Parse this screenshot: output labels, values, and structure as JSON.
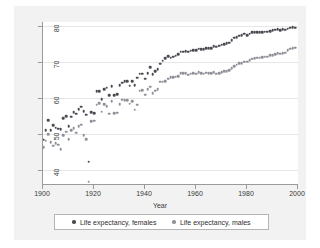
{
  "chart_data": {
    "type": "scatter",
    "title": "",
    "xlabel": "Year",
    "ylabel": "",
    "xlim": [
      1900,
      2000
    ],
    "ylim": [
      36,
      81
    ],
    "xticks": [
      1900,
      1920,
      1940,
      1960,
      1980,
      2000
    ],
    "yticks": [
      40,
      50,
      60,
      70,
      80
    ],
    "grid": "horizontal",
    "legend_position": "bottom",
    "colors": {
      "females": "#4a4a52",
      "males": "#90909a",
      "figure_background": "#f2f2f2",
      "plot_background": "#ffffff",
      "gridline": "#e6e6e6",
      "axis": "#9a9a9a"
    },
    "x": [
      1900,
      1901,
      1902,
      1903,
      1904,
      1905,
      1906,
      1907,
      1908,
      1909,
      1910,
      1911,
      1912,
      1913,
      1914,
      1915,
      1916,
      1917,
      1918,
      1919,
      1920,
      1921,
      1922,
      1923,
      1924,
      1925,
      1926,
      1927,
      1928,
      1929,
      1930,
      1931,
      1932,
      1933,
      1934,
      1935,
      1936,
      1937,
      1938,
      1939,
      1940,
      1941,
      1942,
      1943,
      1944,
      1945,
      1946,
      1947,
      1948,
      1949,
      1950,
      1951,
      1952,
      1953,
      1954,
      1955,
      1956,
      1957,
      1958,
      1959,
      1960,
      1961,
      1962,
      1963,
      1964,
      1965,
      1966,
      1967,
      1968,
      1969,
      1970,
      1971,
      1972,
      1973,
      1974,
      1975,
      1976,
      1977,
      1978,
      1979,
      1980,
      1981,
      1982,
      1983,
      1984,
      1985,
      1986,
      1987,
      1988,
      1989,
      1990,
      1991,
      1992,
      1993,
      1994,
      1995,
      1996,
      1997,
      1998,
      1999
    ],
    "series": [
      {
        "name": "Life expectancy, females",
        "marker": "circle",
        "color": "#4a4a52",
        "values": [
          48.3,
          51.0,
          53.8,
          51.0,
          52.4,
          51.6,
          51.4,
          51.2,
          54.2,
          54.8,
          52.0,
          54.7,
          56.0,
          55.5,
          56.8,
          57.5,
          56.2,
          55.3,
          42.2,
          56.0,
          55.6,
          61.8,
          61.8,
          59.6,
          62.4,
          62.7,
          60.7,
          63.2,
          60.7,
          60.9,
          63.5,
          64.1,
          64.5,
          64.6,
          63.3,
          64.6,
          63.4,
          65.5,
          66.6,
          66.6,
          65.2,
          66.8,
          68.4,
          66.5,
          67.4,
          67.9,
          69.4,
          70.3,
          70.9,
          71.5,
          71.1,
          71.4,
          71.6,
          72.0,
          72.8,
          72.7,
          72.9,
          72.7,
          73.0,
          73.2,
          73.1,
          73.6,
          73.5,
          73.4,
          73.7,
          73.8,
          73.8,
          74.2,
          74.1,
          74.4,
          74.7,
          74.9,
          75.1,
          75.3,
          75.9,
          76.6,
          76.8,
          77.2,
          77.3,
          77.8,
          77.4,
          77.8,
          78.1,
          78.1,
          78.2,
          78.2,
          78.2,
          78.3,
          78.3,
          78.5,
          78.8,
          78.9,
          79.0,
          78.8,
          79.0,
          78.9,
          79.1,
          79.4,
          79.5,
          79.4
        ]
      },
      {
        "name": "Life expectancy, males",
        "marker": "diamond",
        "color": "#90909a",
        "values": [
          46.3,
          48.0,
          49.8,
          47.6,
          46.6,
          47.3,
          46.9,
          45.6,
          49.5,
          50.5,
          48.4,
          50.9,
          51.5,
          50.3,
          52.0,
          52.5,
          49.6,
          48.4,
          36.6,
          53.5,
          53.6,
          58.0,
          58.4,
          56.1,
          58.1,
          57.6,
          55.5,
          59.0,
          55.6,
          55.8,
          58.1,
          59.4,
          59.3,
          59.2,
          58.3,
          59.0,
          56.6,
          58.0,
          61.9,
          62.1,
          60.8,
          62.4,
          63.0,
          61.2,
          61.9,
          62.4,
          64.4,
          64.4,
          64.6,
          65.2,
          65.6,
          65.6,
          65.8,
          66.0,
          66.7,
          66.7,
          66.7,
          66.4,
          66.6,
          66.8,
          66.6,
          67.0,
          66.8,
          66.6,
          66.9,
          66.8,
          66.7,
          67.0,
          66.6,
          66.8,
          67.1,
          67.4,
          67.4,
          67.6,
          68.2,
          68.8,
          69.1,
          69.5,
          69.6,
          70.0,
          70.0,
          70.4,
          70.8,
          71.0,
          71.1,
          71.1,
          71.2,
          71.4,
          71.4,
          71.7,
          71.8,
          72.0,
          72.3,
          72.2,
          72.4,
          72.5,
          73.1,
          73.6,
          73.8,
          73.9
        ]
      }
    ],
    "annotations": [
      {
        "year": 1918,
        "note": "influenza pandemic outliers",
        "females": 42.2,
        "males": 36.6
      }
    ]
  },
  "axes": {
    "x_title": "Year",
    "x_tick_labels": [
      "1900",
      "1920",
      "1940",
      "1960",
      "1980",
      "2000"
    ],
    "y_tick_labels": [
      "40",
      "50",
      "60",
      "70",
      "80"
    ]
  },
  "legend": {
    "entries": [
      {
        "label": "Life expectancy, females"
      },
      {
        "label": "Life expectancy, males"
      }
    ]
  }
}
